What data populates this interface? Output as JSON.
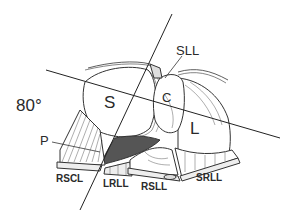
{
  "diagram": {
    "angle_label": "80°",
    "labels": {
      "S": "S",
      "C": "C",
      "L": "L",
      "P": "P",
      "SLL": "SLL",
      "RSCL": "RSCL",
      "LRLL": "LRLL",
      "RSLL": "RSLL",
      "SRLL": "SRLL"
    }
  }
}
